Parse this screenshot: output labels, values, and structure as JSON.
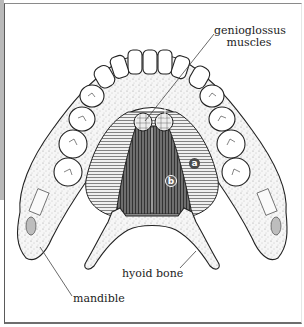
{
  "figure": {
    "labels": {
      "genioglossus": "genioglossus\nmuscles",
      "genioglossus_line1": "genioglossus",
      "genioglossus_line2": "muscles",
      "hyoid": "hyoid bone",
      "mandible": "mandible"
    },
    "markers": {
      "a": "a",
      "b": "b"
    },
    "colors": {
      "line": "#222222",
      "bone_fill": "#f3f3f3",
      "stipple": "#9a9a9a",
      "muscle_light": "#e9e9e9",
      "muscle_dark": "#4a4a4a",
      "frame": "#6e6e6e",
      "left_strip": "#b9b9b9"
    }
  }
}
